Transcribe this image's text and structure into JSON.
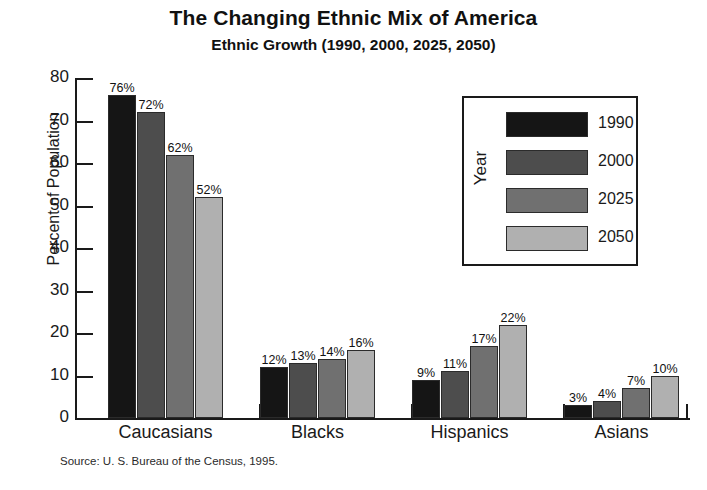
{
  "chart_data": {
    "type": "bar",
    "title": "The Changing Ethnic Mix of America",
    "subtitle": "Ethnic Growth (1990, 2000, 2025, 2050)",
    "xlabel": "",
    "ylabel": "Percent of Population",
    "ylim": [
      0,
      80
    ],
    "ytick_step": 10,
    "yticks": [
      "0",
      "10",
      "20",
      "30",
      "40",
      "50",
      "60",
      "70",
      "80"
    ],
    "grid": false,
    "legend_position": "inside-top-right",
    "legend_title": "Year",
    "value_label_suffix": "%",
    "categories": [
      "Caucasians",
      "Blacks",
      "Hispanics",
      "Asians"
    ],
    "series": [
      {
        "name": "1990",
        "color": "#151515",
        "values": [
          76,
          12,
          9,
          3
        ],
        "labels": [
          "76%",
          "12%",
          "9%",
          "3%"
        ]
      },
      {
        "name": "2000",
        "color": "#4d4d4d",
        "values": [
          72,
          13,
          11,
          4
        ],
        "labels": [
          "72%",
          "13%",
          "11%",
          "4%"
        ]
      },
      {
        "name": "2025",
        "color": "#707070",
        "values": [
          62,
          14,
          17,
          7
        ],
        "labels": [
          "62%",
          "14%",
          "17%",
          "7%"
        ]
      },
      {
        "name": "2050",
        "color": "#b0b0b0",
        "values": [
          52,
          16,
          22,
          10
        ],
        "labels": [
          "52%",
          "16%",
          "22%",
          "10%"
        ]
      }
    ],
    "source": "Source: U. S. Bureau of the Census, 1995."
  }
}
